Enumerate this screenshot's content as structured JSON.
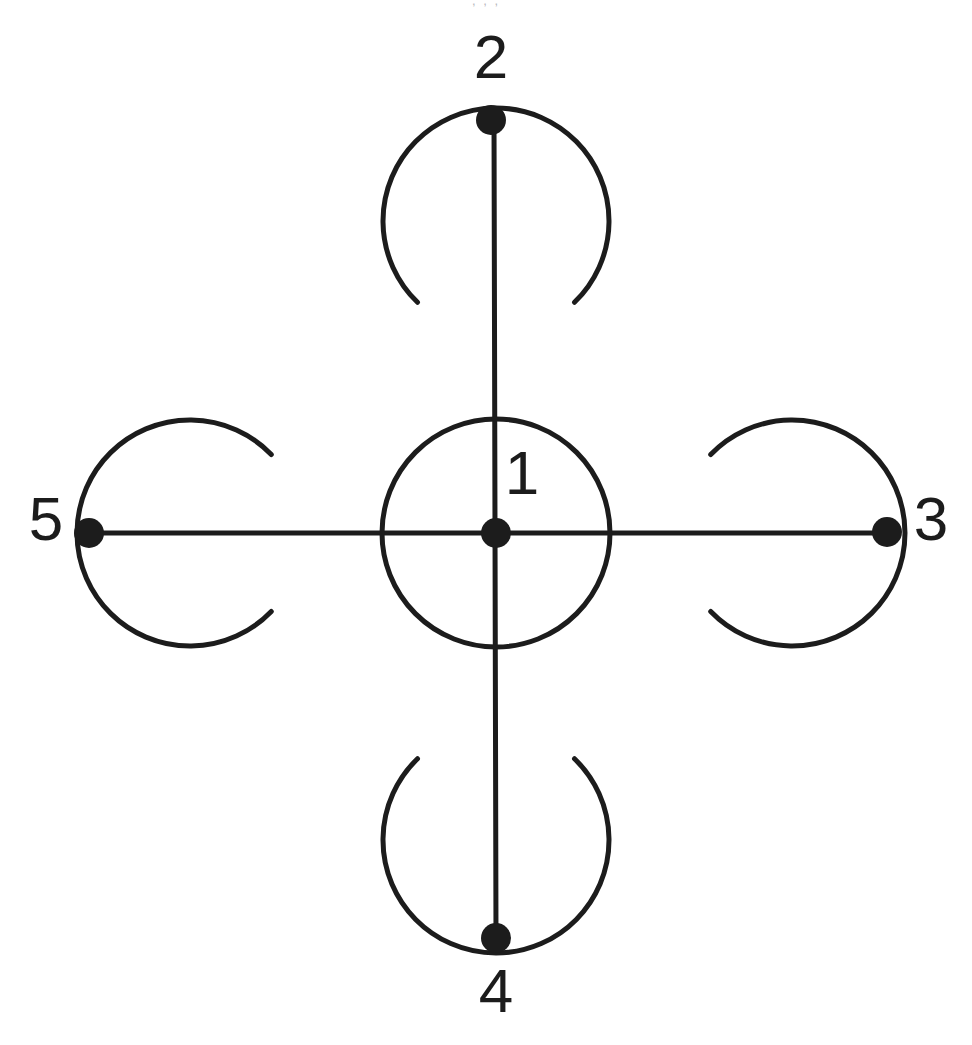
{
  "page": {
    "background_color": "#ffffff",
    "ink_color": "#1c1c1c",
    "width": 972,
    "height": 1045,
    "clipped_top_text": ", , ,"
  },
  "diagram": {
    "type": "node-link-schematic",
    "stroke_color": "#1c1c1c",
    "stroke_width": 5,
    "label_font_size": 62,
    "nodes": [
      {
        "id": "node-1",
        "label": "1",
        "cx": 496,
        "cy": 533,
        "r": 15,
        "label_x": 522,
        "label_y": 478,
        "ring_r": 114,
        "ring_type": "closed-circle",
        "ring_cx": 496,
        "ring_cy": 533,
        "gap_direction": "none"
      },
      {
        "id": "node-2",
        "label": "2",
        "cx": 491,
        "cy": 120,
        "r": 15,
        "label_x": 491,
        "label_y": 62,
        "ring_r": 113,
        "ring_type": "open-arc",
        "ring_cx": 496,
        "ring_cy": 221,
        "gap_direction": "down"
      },
      {
        "id": "node-3",
        "label": "3",
        "cx": 887,
        "cy": 532,
        "r": 15,
        "label_x": 931,
        "label_y": 524,
        "ring_r": 113,
        "ring_type": "open-arc",
        "ring_cx": 792,
        "ring_cy": 533,
        "gap_direction": "left"
      },
      {
        "id": "node-4",
        "label": "4",
        "cx": 496,
        "cy": 938,
        "r": 15,
        "label_x": 496,
        "label_y": 996,
        "ring_r": 113,
        "ring_type": "open-arc",
        "ring_cx": 496,
        "ring_cy": 840,
        "gap_direction": "up"
      },
      {
        "id": "node-5",
        "label": "5",
        "cx": 89,
        "cy": 533,
        "r": 15,
        "label_x": 46,
        "label_y": 524,
        "ring_r": 113,
        "ring_type": "open-arc",
        "ring_cx": 190,
        "ring_cy": 533,
        "gap_direction": "right"
      }
    ],
    "edges": [
      {
        "id": "edge-5-3",
        "from": "node-5",
        "to": "node-3",
        "orientation": "horizontal",
        "x1": 89,
        "y1": 533,
        "x2": 887,
        "y2": 533
      },
      {
        "id": "edge-2-4",
        "from": "node-2",
        "to": "node-4",
        "orientation": "vertical",
        "x1": 494,
        "y1": 120,
        "x2": 496,
        "y2": 938
      }
    ]
  }
}
